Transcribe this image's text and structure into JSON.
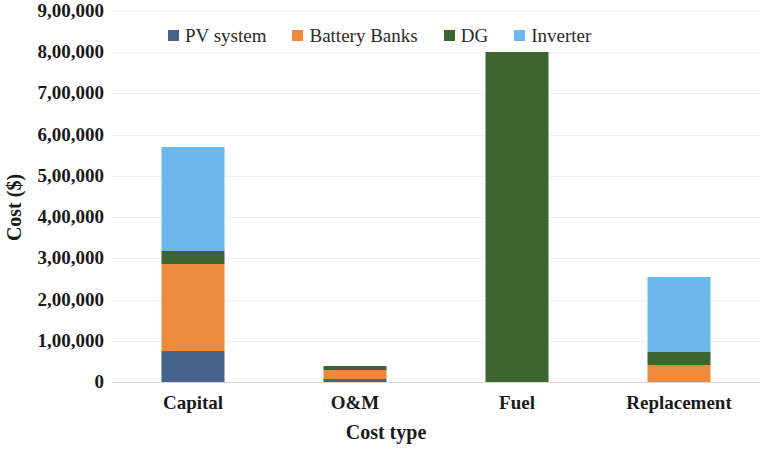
{
  "chart_data": {
    "type": "bar",
    "subtype": "stacked-bar",
    "title": "",
    "xlabel": "Cost type",
    "ylabel": "Cost ($)",
    "categories": [
      "Capital",
      "O&M",
      "Fuel",
      "Replacement"
    ],
    "series": [
      {
        "name": "PV system",
        "color": "#44618a",
        "values": [
          75000,
          8000,
          0,
          0
        ]
      },
      {
        "name": "Battery Banks",
        "color": "#ed8a3c",
        "values": [
          211000,
          20000,
          0,
          42000
        ]
      },
      {
        "name": "DG",
        "color": "#3b662f",
        "values": [
          32000,
          10000,
          800000,
          32000
        ]
      },
      {
        "name": "Inverter",
        "color": "#6cb8ec",
        "values": [
          252000,
          0,
          0,
          180000
        ]
      }
    ],
    "totals": [
      570000,
      38000,
      800000,
      254000
    ],
    "ylim": [
      0,
      900000
    ],
    "ytick_values": [
      0,
      100000,
      200000,
      300000,
      400000,
      500000,
      600000,
      700000,
      800000,
      900000
    ],
    "ytick_labels": [
      "0",
      "1,00,000",
      "2,00,000",
      "3,00,000",
      "4,00,000",
      "5,00,000",
      "6,00,000",
      "7,00,000",
      "8,00,000",
      "9,00,000"
    ],
    "grid": true,
    "grid_color": "#f0f0f0",
    "legend_position": "top",
    "legend": [
      "PV system",
      "Battery Banks",
      "DG",
      "Inverter"
    ]
  }
}
